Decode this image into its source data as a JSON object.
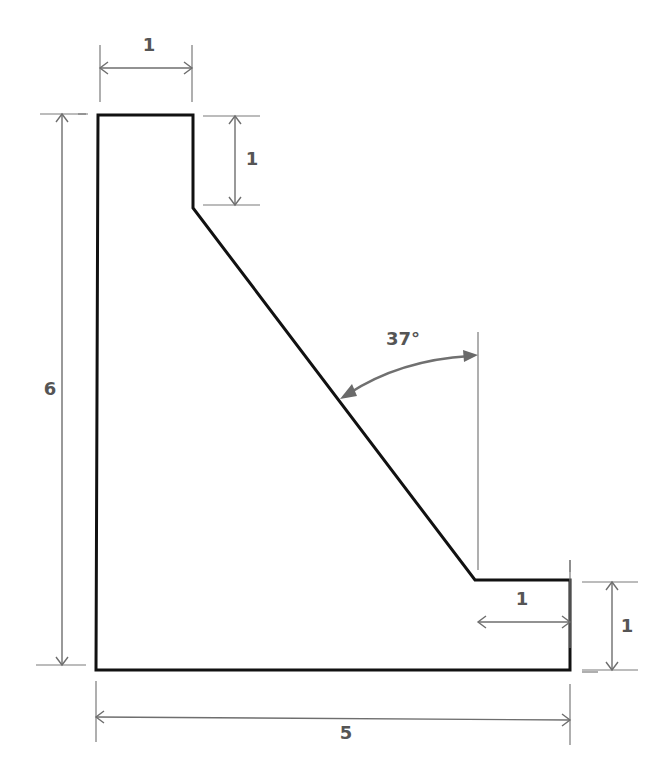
{
  "diagram": {
    "type": "engineering-dimension-drawing",
    "shape": "retaining-wall cross-section",
    "dimensions": {
      "top_width": {
        "label": "1",
        "value": 1
      },
      "top_vertical_step": {
        "label": "1",
        "value": 1
      },
      "total_height": {
        "label": "6",
        "value": 6
      },
      "toe_width": {
        "label": "1",
        "value": 1
      },
      "toe_height": {
        "label": "1",
        "value": 1
      },
      "base_width": {
        "label": "5",
        "value": 5
      }
    },
    "angle": {
      "label": "37°",
      "value": 37,
      "unit": "degrees",
      "reference": "vertical"
    },
    "colors": {
      "outline": "#111111",
      "dimension_lines": "#6e6e6e",
      "labels": "#555555",
      "background": "#ffffff"
    }
  }
}
